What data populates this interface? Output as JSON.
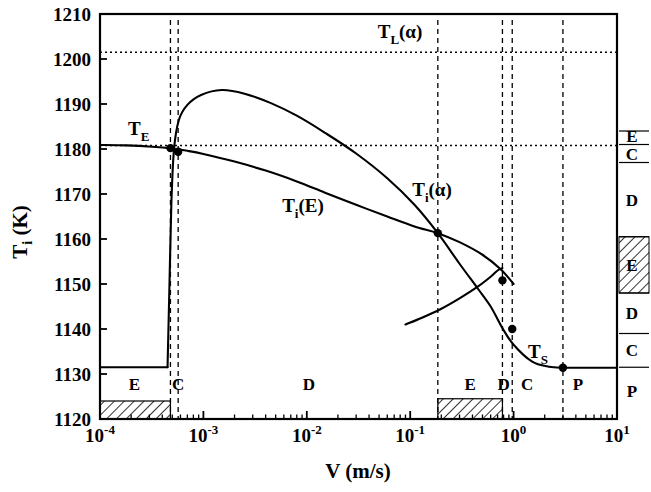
{
  "figure": {
    "kind": "phase-selection-map",
    "background": "#ffffff",
    "ink": "#000000"
  },
  "axes": {
    "xlabel": "V (m/s)",
    "ylabel_parts": {
      "main": "T",
      "sub": "i",
      "unit": " (K)"
    },
    "ylabel": "Ti (K)",
    "x_tick_labels": [
      "10-4",
      "10-3",
      "10-2",
      "10-1",
      "100",
      "101"
    ],
    "x_tick_mantissa": "10",
    "x_tick_exponents": [
      "-4",
      "-3",
      "-2",
      "-1",
      "0",
      "1"
    ],
    "y_tick_labels": [
      "1120",
      "1130",
      "1140",
      "1150",
      "1160",
      "1170",
      "1180",
      "1190",
      "1200",
      "1210"
    ]
  },
  "annotations": {
    "T_E": {
      "main": "T",
      "sub": "E",
      "paren": ""
    },
    "T_L_a": {
      "main": "T",
      "sub": "L",
      "paren": "(α)"
    },
    "T_i_a": {
      "main": "T",
      "sub": "i",
      "paren": "(α)"
    },
    "T_i_E": {
      "main": "T",
      "sub": "i",
      "paren": "(E)"
    },
    "T_S": {
      "main": "T",
      "sub": "S",
      "paren": ""
    }
  },
  "bottom_region_labels": [
    {
      "label": "E",
      "x": 0.000215
    },
    {
      "label": "C",
      "x": 0.00057
    },
    {
      "label": "D",
      "x": 0.0105
    },
    {
      "label": "E",
      "x": 0.38
    },
    {
      "label": "D",
      "x": 0.8
    },
    {
      "label": "C",
      "x": 1.35
    },
    {
      "label": "P",
      "x": 4.2
    }
  ],
  "right_column_labels": [
    {
      "label": "E",
      "t_top": 1184.0,
      "t_bot": 1181.6,
      "hatched": false
    },
    {
      "label": "C",
      "t_top": 1181.0,
      "t_bot": 1177.0,
      "hatched": false
    },
    {
      "label": "D",
      "t_top": 1177.0,
      "t_bot": 1160.5,
      "hatched": false
    },
    {
      "label": "E",
      "t_top": 1160.5,
      "t_bot": 1148.0,
      "hatched": true
    },
    {
      "label": "D",
      "t_top": 1148.0,
      "t_bot": 1139.0,
      "hatched": false
    },
    {
      "label": "C",
      "t_top": 1139.0,
      "t_bot": 1131.5,
      "hatched": false
    },
    {
      "label": "P",
      "t_top": 1131.5,
      "t_bot": 1121.0,
      "hatched": false
    }
  ],
  "chart_data": {
    "type": "line",
    "title": "",
    "xlabel": "V (m/s)",
    "ylabel": "Ti (K)",
    "xscale": "log",
    "xlim": [
      0.0001,
      10
    ],
    "ylim": [
      1120,
      1210
    ],
    "grid": false,
    "legend": "none",
    "horizontal_reference_lines": [
      {
        "name": "T_L(alpha)",
        "value": 1201.5,
        "style": "dotted"
      },
      {
        "name": "T_E",
        "value": 1180.8,
        "style": "dotted"
      }
    ],
    "series": [
      {
        "name": "T_i(E)",
        "style": "solid",
        "comment": "eutectic interface temperature branch; flat then steadily decreasing",
        "points": [
          [
            0.0001,
            1180.9
          ],
          [
            0.00018,
            1180.8
          ],
          [
            0.00032,
            1180.5
          ],
          [
            0.0005,
            1180.1
          ],
          [
            0.0007,
            1179.6
          ],
          [
            0.001,
            1178.9
          ],
          [
            0.002,
            1177.2
          ],
          [
            0.004,
            1175.2
          ],
          [
            0.008,
            1172.8
          ],
          [
            0.015,
            1170.3
          ],
          [
            0.03,
            1167.6
          ],
          [
            0.06,
            1165.0
          ],
          [
            0.11,
            1162.8
          ],
          [
            0.185,
            1161.3
          ],
          [
            0.3,
            1159.3
          ],
          [
            0.5,
            1156.5
          ],
          [
            0.75,
            1153.3
          ],
          [
            1.0,
            1150.0
          ]
        ]
      },
      {
        "name": "T_i(alpha)",
        "style": "solid",
        "comment": "primary alpha branch: steep rise at ~4.5e-4, peak 1193 K near 1.5e-3, then falls",
        "points": [
          [
            0.00045,
            1131.5
          ],
          [
            0.00047,
            1150.0
          ],
          [
            0.00049,
            1168.0
          ],
          [
            0.00052,
            1180.0
          ],
          [
            0.00058,
            1186.5
          ],
          [
            0.0007,
            1189.8
          ],
          [
            0.00095,
            1192.0
          ],
          [
            0.0015,
            1193.1
          ],
          [
            0.0025,
            1192.3
          ],
          [
            0.0045,
            1190.2
          ],
          [
            0.008,
            1187.4
          ],
          [
            0.015,
            1183.6
          ],
          [
            0.03,
            1179.0
          ],
          [
            0.06,
            1173.5
          ],
          [
            0.11,
            1167.6
          ],
          [
            0.185,
            1161.3
          ],
          [
            0.3,
            1154.5
          ],
          [
            0.45,
            1149.0
          ],
          [
            0.6,
            1145.0
          ],
          [
            0.78,
            1140.2
          ],
          [
            1.0,
            1136.5
          ],
          [
            1.5,
            1132.8
          ],
          [
            2.2,
            1131.6
          ],
          [
            3.0,
            1131.4
          ]
        ]
      },
      {
        "name": "lower-branch",
        "style": "solid",
        "comment": "short lower branch rising toward the upper curve, left end at ~0.09 m/s",
        "points": [
          [
            0.09,
            1141.0
          ],
          [
            0.13,
            1142.5
          ],
          [
            0.2,
            1144.5
          ],
          [
            0.3,
            1146.8
          ],
          [
            0.45,
            1149.4
          ],
          [
            0.6,
            1151.6
          ],
          [
            0.7,
            1153.0
          ],
          [
            0.78,
            1153.5
          ]
        ]
      },
      {
        "name": "T_E-plateau",
        "style": "solid",
        "comment": "flat eutectic-temperature floor at low velocity ending in a vertical jump",
        "points": [
          [
            0.0001,
            1131.5
          ],
          [
            0.00045,
            1131.5
          ]
        ]
      },
      {
        "name": "T_S-plateau",
        "style": "solid",
        "comment": "solidus plateau at high velocity",
        "points": [
          [
            3.0,
            1131.4
          ],
          [
            10.0,
            1131.4
          ]
        ]
      }
    ],
    "markers": [
      {
        "label": "",
        "x": 0.00048,
        "y": 1180.2
      },
      {
        "label": "",
        "x": 0.00057,
        "y": 1179.4
      },
      {
        "label": "",
        "x": 0.185,
        "y": 1161.3
      },
      {
        "label": "",
        "x": 0.78,
        "y": 1150.8
      },
      {
        "label": "",
        "x": 0.97,
        "y": 1140.0
      },
      {
        "label": "",
        "x": 3.0,
        "y": 1131.4
      }
    ],
    "vertical_dashed_lines": [
      {
        "x": 0.00048
      },
      {
        "x": 0.00057
      },
      {
        "x": 0.185
      },
      {
        "x": 0.78
      },
      {
        "x": 0.97
      },
      {
        "x": 3.0
      }
    ],
    "hatched_bands_bottom": [
      {
        "x_from": 0.0001,
        "x_to": 0.00048,
        "t_from": 1120.0,
        "t_to": 1124.0
      },
      {
        "x_from": 0.185,
        "x_to": 0.78,
        "t_from": 1120.0,
        "t_to": 1124.5
      }
    ]
  }
}
